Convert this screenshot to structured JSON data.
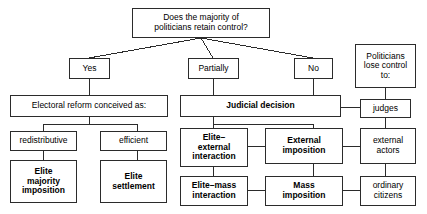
{
  "diagram": {
    "line_color": "#2b2b2b",
    "background": "#ffffff",
    "text_color": "#000000",
    "nodes": {
      "root": "Does the majority of\npoliticians retain control?",
      "yes": "Yes",
      "partially": "Partially",
      "no": "No",
      "lose_control": "Politicians\nlose control\nto:",
      "electoral_reform": "Electoral reform conceived as:",
      "judicial_decision": "Judicial decision",
      "judges": "judges",
      "redistributive": "redistributive",
      "efficient": "efficient",
      "elite_external": "Elite–\nexternal\ninteraction",
      "external_imposition": "External\nimposition",
      "external_actors": "external\nactors",
      "elite_majority": "Elite\nmajority\nimposition",
      "elite_settlement": "Elite\nsettlement",
      "elite_mass": "Elite–mass\ninteraction",
      "mass_imposition": "Mass\nimposition",
      "ordinary_citizens": "ordinary\ncitizens"
    }
  }
}
